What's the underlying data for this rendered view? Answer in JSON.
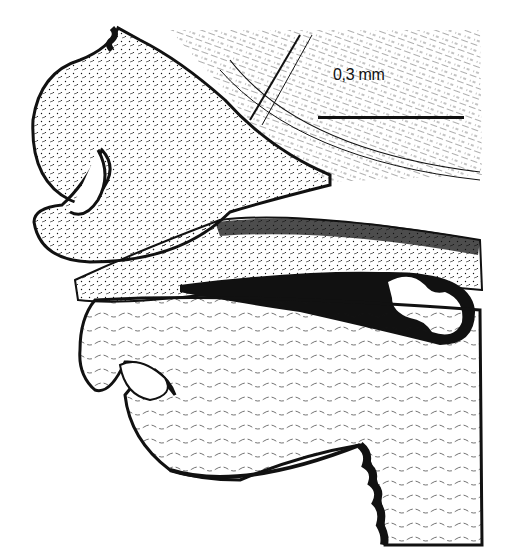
{
  "figure": {
    "type": "histological pen-and-ink illustration",
    "colors": {
      "ink": "#111111",
      "paper": "#ffffff"
    },
    "scale_bar": {
      "label": "0,3 mm"
    },
    "structures": [
      {
        "name": "upper-fold",
        "description": "upper curled tissue lobe with inward-folding lip"
      },
      {
        "name": "lower-fold",
        "description": "lower curled tissue lobe with inward-folding lip"
      },
      {
        "name": "central-lumen",
        "description": "elongated dark slit-shaped cavity with bilobed white lumen at right end"
      },
      {
        "name": "fibrous-tissue",
        "description": "striated tissue band at upper right"
      },
      {
        "name": "scalloped-edges",
        "description": "dark scalloped margins at top-left and bottom-center"
      }
    ]
  }
}
